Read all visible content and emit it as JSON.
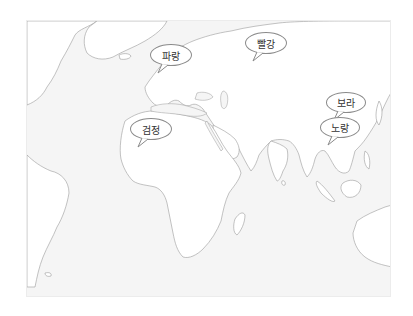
{
  "map": {
    "description": "Blank world map centered on Europe, Africa and Asia",
    "colors": {
      "ocean": "#f5f5f5",
      "land": "#ffffff",
      "coastline": "#9a9a9a",
      "bubble_border": "#8a8a8a",
      "label_text": "#333333"
    },
    "labels": [
      {
        "id": "blue",
        "text": "파랑",
        "region": "Scandinavia"
      },
      {
        "id": "red",
        "text": "빨강",
        "region": "Northern Russia"
      },
      {
        "id": "black",
        "text": "검정",
        "region": "North Africa"
      },
      {
        "id": "purple",
        "text": "보라",
        "region": "East China / Korea"
      },
      {
        "id": "yellow",
        "text": "노랑",
        "region": "Southeast Asia"
      }
    ]
  }
}
